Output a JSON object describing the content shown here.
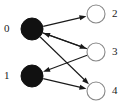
{
  "figure": {
    "type": "directed-bipartite-graph",
    "width": 126,
    "height": 108,
    "background_color": "#ffffff",
    "edge_color": "#1a1a1a",
    "filled_node_fill": "#111111",
    "filled_node_stroke": "#111111",
    "open_node_fill": "#ffffff",
    "open_node_stroke": "#888888"
  },
  "nodes": [
    {
      "id": "0",
      "label": "0",
      "cx": 32,
      "cy": 29,
      "r": 11,
      "style": "filled",
      "label_x": 4,
      "label_y": 23
    },
    {
      "id": "1",
      "label": "1",
      "cx": 32,
      "cy": 76,
      "r": 11,
      "style": "filled",
      "label_x": 4,
      "label_y": 70
    },
    {
      "id": "2",
      "label": "2",
      "cx": 96,
      "cy": 14,
      "r": 9,
      "style": "open",
      "label_x": 112,
      "label_y": 8
    },
    {
      "id": "3",
      "label": "3",
      "cx": 96,
      "cy": 52,
      "r": 9,
      "style": "open",
      "label_x": 112,
      "label_y": 46
    },
    {
      "id": "4",
      "label": "4",
      "cx": 96,
      "cy": 91,
      "r": 9,
      "style": "open",
      "label_x": 112,
      "label_y": 85
    }
  ],
  "edges": [
    {
      "id": "e-0-2",
      "from": "0",
      "to": "2",
      "arrow": "end"
    },
    {
      "id": "e-0-3",
      "from": "0",
      "to": "3",
      "arrow": "end"
    },
    {
      "id": "e-0-4",
      "from": "0",
      "to": "4",
      "arrow": "end"
    },
    {
      "id": "e-3-0",
      "from": "3",
      "to": "0",
      "arrow": "end"
    },
    {
      "id": "e-3-1",
      "from": "3",
      "to": "1",
      "arrow": "end"
    },
    {
      "id": "e-1-4",
      "from": "1",
      "to": "4",
      "arrow": "end"
    }
  ]
}
